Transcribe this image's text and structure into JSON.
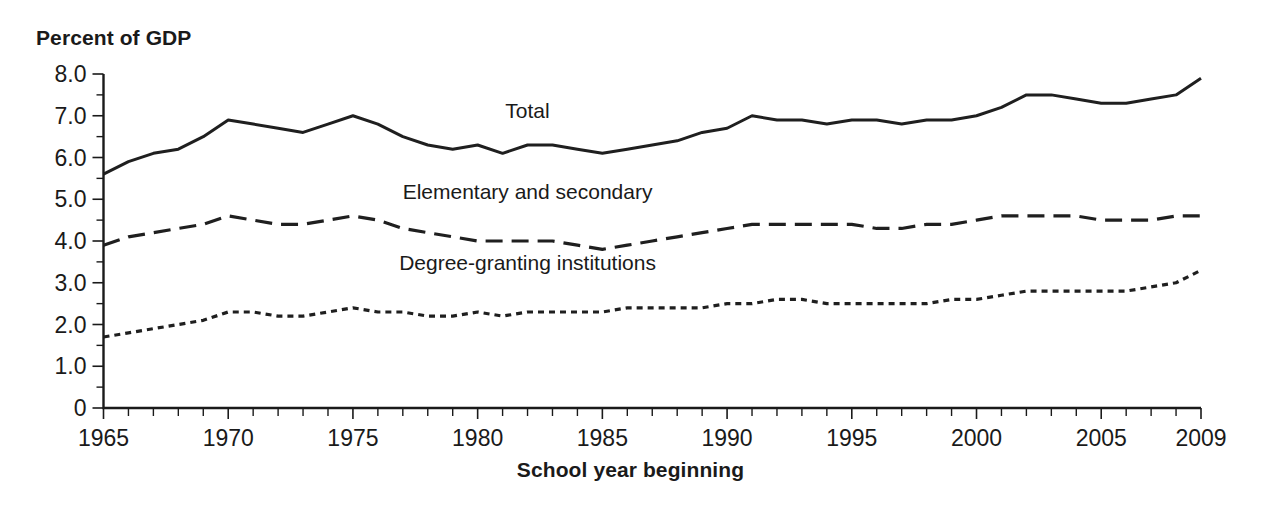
{
  "chart_data": {
    "type": "line",
    "title": "",
    "ylabel": "Percent of GDP",
    "xlabel": "School year beginning",
    "ylim": [
      0,
      8.0
    ],
    "xlim": [
      1965,
      2009
    ],
    "grid": false,
    "legend_position": "inline-labels",
    "y_ticks": [
      "0",
      "1.0",
      "2.0",
      "3.0",
      "4.0",
      "5.0",
      "6.0",
      "7.0",
      "8.0"
    ],
    "y_tick_values": [
      0,
      1.0,
      2.0,
      3.0,
      4.0,
      5.0,
      6.0,
      7.0,
      8.0
    ],
    "y_minor_tick_interval": 0.5,
    "x_ticks": [
      "1965",
      "1970",
      "1975",
      "1980",
      "1985",
      "1990",
      "1995",
      "2000",
      "2005",
      "2009"
    ],
    "x_tick_values": [
      1965,
      1970,
      1975,
      1980,
      1985,
      1990,
      1995,
      2000,
      2005,
      2009
    ],
    "x_minor_tick_interval": 1,
    "x": [
      1965,
      1966,
      1967,
      1968,
      1969,
      1970,
      1971,
      1972,
      1973,
      1974,
      1975,
      1976,
      1977,
      1978,
      1979,
      1980,
      1981,
      1982,
      1983,
      1984,
      1985,
      1986,
      1987,
      1988,
      1989,
      1990,
      1991,
      1992,
      1993,
      1994,
      1995,
      1996,
      1997,
      1998,
      1999,
      2000,
      2001,
      2002,
      2003,
      2004,
      2005,
      2006,
      2007,
      2008,
      2009
    ],
    "series": [
      {
        "name": "Total",
        "linestyle": "solid",
        "label_x": 1982,
        "label_y": 6.95,
        "values": [
          5.6,
          5.9,
          6.1,
          6.2,
          6.5,
          6.9,
          6.8,
          6.7,
          6.6,
          6.8,
          7.0,
          6.8,
          6.5,
          6.3,
          6.2,
          6.3,
          6.1,
          6.3,
          6.3,
          6.2,
          6.1,
          6.2,
          6.3,
          6.4,
          6.6,
          6.7,
          7.0,
          6.9,
          6.9,
          6.8,
          6.9,
          6.9,
          6.8,
          6.9,
          6.9,
          7.0,
          7.2,
          7.5,
          7.5,
          7.4,
          7.3,
          7.3,
          7.4,
          7.5,
          7.9
        ]
      },
      {
        "name": "Elementary and secondary",
        "linestyle": "dashed",
        "label_x": 1982,
        "label_y": 5.0,
        "values": [
          3.9,
          4.1,
          4.2,
          4.3,
          4.4,
          4.6,
          4.5,
          4.4,
          4.4,
          4.5,
          4.6,
          4.5,
          4.3,
          4.2,
          4.1,
          4.0,
          4.0,
          4.0,
          4.0,
          3.9,
          3.8,
          3.9,
          4.0,
          4.1,
          4.2,
          4.3,
          4.4,
          4.4,
          4.4,
          4.4,
          4.4,
          4.3,
          4.3,
          4.4,
          4.4,
          4.5,
          4.6,
          4.6,
          4.6,
          4.6,
          4.5,
          4.5,
          4.5,
          4.6,
          4.6
        ]
      },
      {
        "name": "Degree-granting institutions",
        "linestyle": "dotted",
        "label_x": 1982,
        "label_y": 3.3,
        "values": [
          1.7,
          1.8,
          1.9,
          2.0,
          2.1,
          2.3,
          2.3,
          2.2,
          2.2,
          2.3,
          2.4,
          2.3,
          2.3,
          2.2,
          2.2,
          2.3,
          2.2,
          2.3,
          2.3,
          2.3,
          2.3,
          2.4,
          2.4,
          2.4,
          2.4,
          2.5,
          2.5,
          2.6,
          2.6,
          2.5,
          2.5,
          2.5,
          2.5,
          2.5,
          2.6,
          2.6,
          2.7,
          2.8,
          2.8,
          2.8,
          2.8,
          2.8,
          2.9,
          3.0,
          3.3
        ]
      }
    ]
  },
  "axis": {
    "y_title": "Percent of GDP",
    "x_title": "School year beginning"
  },
  "colors": {
    "ink": "#1a1a1a",
    "line": "#1f1f1f",
    "background": "#ffffff"
  }
}
